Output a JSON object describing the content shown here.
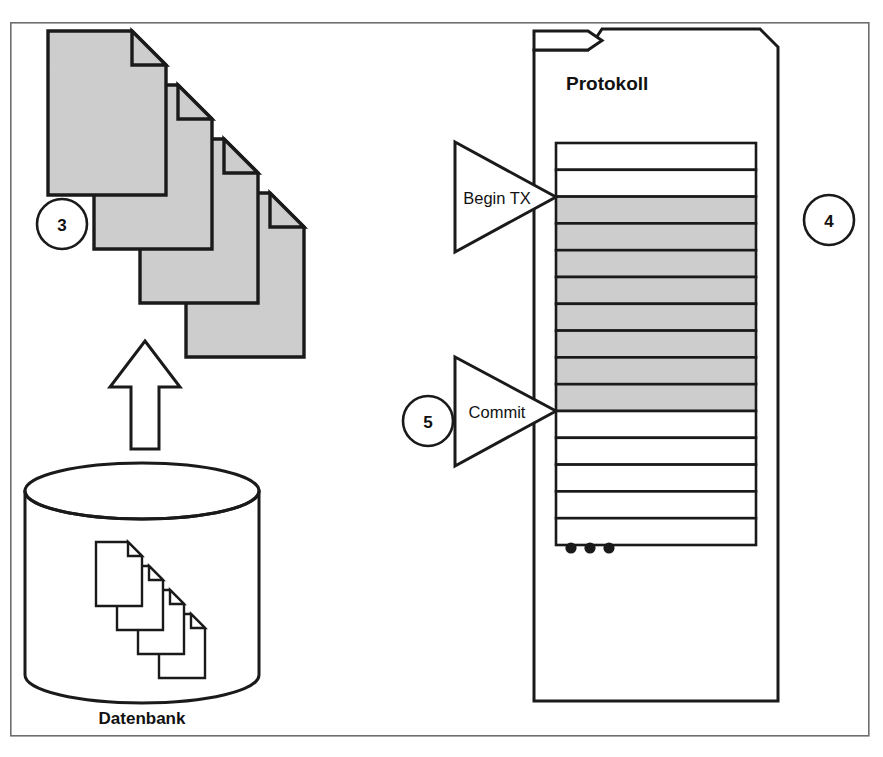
{
  "figure": {
    "type": "diagram",
    "subtype": "database-transaction-log-flow",
    "language": "de",
    "background_color": "#ffffff",
    "line_color": "#1a1a1a",
    "shade_color": "#cdcdcd",
    "frame_color": "#6e6e6e"
  },
  "labels": {
    "database_caption": "Datenbank",
    "log_heading": "Protokoll",
    "begin_tx": "Begin TX",
    "commit": "Commit",
    "ellipsis": "•••"
  },
  "step_markers": [
    {
      "id": "marker-3",
      "number": "3",
      "cx": 62,
      "cy": 224,
      "r": 25
    },
    {
      "id": "marker-4",
      "number": "4",
      "cx": 829,
      "cy": 220,
      "r": 25
    },
    {
      "id": "marker-5",
      "number": "5",
      "cx": 428,
      "cy": 421,
      "r": 25
    }
  ],
  "document_stack": {
    "count": 4,
    "filled": true,
    "fill": "#cdcdcd",
    "page_width": 118,
    "page_height": 164,
    "fold_size": 34,
    "origin": {
      "x": 48,
      "y": 31
    },
    "step": {
      "x": 46,
      "y": 54
    }
  },
  "database": {
    "caption": "Datenbank",
    "cylinder": {
      "cx": 142,
      "cy_top": 491,
      "rx": 117,
      "ry": 28,
      "body_height": 184
    },
    "inner_stack": {
      "count": 4,
      "filled": false,
      "page_width": 46,
      "page_height": 64,
      "fold_size": 14,
      "origin": {
        "x": 96,
        "y": 542
      },
      "step": {
        "x": 21,
        "y": 24
      }
    }
  },
  "up_arrow": {
    "tip_y": 341,
    "base_y": 449,
    "shaft_half_width": 14,
    "head_half_width": 35,
    "center_x": 145
  },
  "log": {
    "heading": "Protokoll",
    "outer_box": {
      "x": 531,
      "y": 29,
      "width": 247,
      "height": 672,
      "corner_cut": 18
    },
    "tab": {
      "x": 534,
      "y": 29,
      "width": 68,
      "height": 21,
      "slant": 14
    },
    "table": {
      "x": 556,
      "y": 143,
      "width": 200,
      "row_height": 26.8
    },
    "rows": [
      {
        "index": 1,
        "state": "empty"
      },
      {
        "index": 2,
        "state": "empty"
      },
      {
        "index": 3,
        "state": "transaction"
      },
      {
        "index": 4,
        "state": "transaction"
      },
      {
        "index": 5,
        "state": "transaction"
      },
      {
        "index": 6,
        "state": "transaction"
      },
      {
        "index": 7,
        "state": "transaction"
      },
      {
        "index": 8,
        "state": "transaction"
      },
      {
        "index": 9,
        "state": "transaction"
      },
      {
        "index": 10,
        "state": "transaction"
      },
      {
        "index": 11,
        "state": "empty"
      },
      {
        "index": 12,
        "state": "empty"
      },
      {
        "index": 13,
        "state": "empty"
      },
      {
        "index": 14,
        "state": "empty"
      },
      {
        "index": 15,
        "state": "empty"
      }
    ],
    "row_counts": {
      "total": 15,
      "empty_top": 2,
      "transaction": 8,
      "empty_bottom": 5
    },
    "ellipsis_dots": 3,
    "ellipsis_position": {
      "x": 571,
      "y": 548
    }
  },
  "pointers": [
    {
      "id": "begin-tx-pointer",
      "label": "Begin TX",
      "shape": "triangle-right",
      "apex": {
        "x": 556,
        "y": 197
      },
      "back_x": 455,
      "top_y": 142,
      "bottom_y": 252,
      "target_row_index": 3
    },
    {
      "id": "commit-pointer",
      "label": "Commit",
      "shape": "triangle-right",
      "apex": {
        "x": 556,
        "y": 411
      },
      "back_x": 455,
      "top_y": 357,
      "bottom_y": 466,
      "target_row_index": 10
    }
  ],
  "outer_frame": {
    "x": 10,
    "y": 22,
    "width": 860,
    "height": 714
  }
}
